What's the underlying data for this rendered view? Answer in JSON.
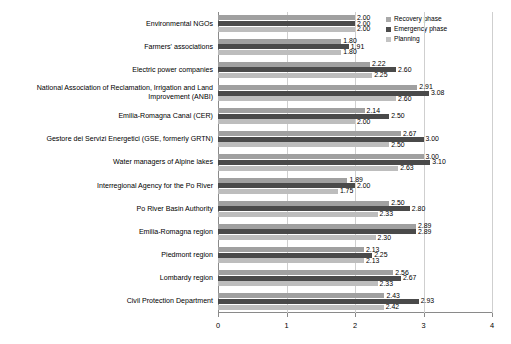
{
  "chart_data": {
    "type": "bar",
    "orientation": "horizontal",
    "title": "",
    "xlabel": "",
    "ylabel": "",
    "xlim": [
      0,
      4
    ],
    "xticks": [
      "0",
      "1",
      "2",
      "3",
      "4"
    ],
    "grid": true,
    "legend_position": "top-right",
    "legend": [
      "Recovery phase",
      "Emergency phase",
      "Planning"
    ],
    "categories": [
      "Environmental NGOs",
      "Farmers' associations",
      "Electric power companies",
      "National Association of Reclamation, Irrigation and Land Improvement (ANBI)",
      "Emilia-Romagna Canal (CER)",
      "Gestore dei Servizi Energetici (GSE, formerly GRTN)",
      "Water managers of Alpine lakes",
      "Interregional Agency for the Po River",
      "Po River Basin Authority",
      "Emilia-Romagna region",
      "Piedmont region",
      "Lombardy region",
      "Civil Protection Department"
    ],
    "series": [
      {
        "name": "Recovery phase",
        "color": "#a0a0a0",
        "values": [
          2.0,
          1.8,
          2.22,
          2.91,
          2.14,
          2.67,
          3.0,
          1.89,
          2.5,
          2.89,
          2.13,
          2.56,
          2.43
        ],
        "labels": [
          "2.00",
          "1.80",
          "2.22",
          "2.91",
          "2.14",
          "2.67",
          "3.00",
          "1.89",
          "2.50",
          "2.89",
          "2.13",
          "2.56",
          "2.43"
        ]
      },
      {
        "name": "Emergency phase",
        "color": "#4a4a4a",
        "values": [
          2.0,
          1.91,
          2.6,
          3.08,
          2.5,
          3.0,
          3.1,
          2.0,
          2.8,
          2.89,
          2.25,
          2.67,
          2.93
        ],
        "labels": [
          "2.00",
          "1.91",
          "2.60",
          "3.08",
          "2.50",
          "3.00",
          "3.10",
          "2.00",
          "2.80",
          "2.89",
          "2.25",
          "2.67",
          "2.93"
        ]
      },
      {
        "name": "Planning",
        "color": "#bdbdbd",
        "values": [
          2.0,
          1.8,
          2.25,
          2.6,
          2.0,
          2.5,
          2.63,
          1.75,
          2.33,
          2.3,
          2.13,
          2.33,
          2.42
        ],
        "labels": [
          "2.00",
          "1.80",
          "2.25",
          "2.60",
          "2.00",
          "2.50",
          "2.63",
          "1.75",
          "2.33",
          "2.30",
          "2.13",
          "2.33",
          "2.42"
        ]
      }
    ]
  }
}
